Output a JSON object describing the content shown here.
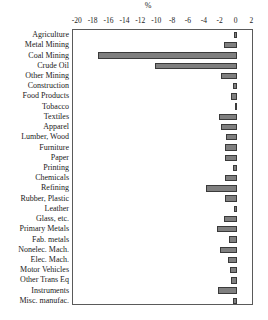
{
  "chart_data": {
    "type": "bar",
    "orientation": "horizontal",
    "title": "",
    "subtitle": "",
    "xlabel": "%",
    "ylabel": "",
    "xlim": [
      -20.6,
      2.2
    ],
    "ylim": [
      0,
      25
    ],
    "grid": false,
    "legend": null,
    "xticks": [
      -20,
      -18,
      -16,
      -14,
      -12,
      -10,
      -8,
      -6,
      -4,
      -2,
      0,
      2
    ],
    "xticklabels": [
      "-20",
      "-18",
      "-16",
      "-14",
      "-12",
      "-10",
      "-8",
      "-6",
      "-4",
      "-2",
      "0",
      "2"
    ],
    "categories": [
      "Agriculture",
      "Metal Mining",
      "Coal Mining",
      "Crude Oil",
      "Other Mining",
      "Construction",
      "Food Products",
      "Tobacco",
      "Textiles",
      "Apparel",
      "Lumber, Wood",
      "Furniture",
      "Paper",
      "Printing",
      "Chemicals",
      "Refining",
      "Rubber, Plastic",
      "Leather",
      "Glass, etc.",
      "Primary Metals",
      "Fab. metals",
      "Nonelec. Mach.",
      "Elec. Mach.",
      "Motor Vehicles",
      "Other Trans Eq",
      "Instruments",
      "Misc. manufac."
    ],
    "values": [
      -0.3,
      -1.6,
      -17.5,
      -10.3,
      -1.9,
      -0.5,
      -0.7,
      -0.2,
      -2.2,
      -2.0,
      -1.3,
      -1.4,
      -1.5,
      -0.5,
      -1.5,
      -3.8,
      -1.4,
      -0.3,
      -1.6,
      -2.4,
      -0.9,
      -2.1,
      -1.1,
      -0.8,
      -0.7,
      -2.3,
      -0.4
    ],
    "bar_color": "#7f7f7f",
    "bar_edge_color": "#3a3a3a",
    "frame_color": "#5a5a5a",
    "background": "#ffffff"
  }
}
